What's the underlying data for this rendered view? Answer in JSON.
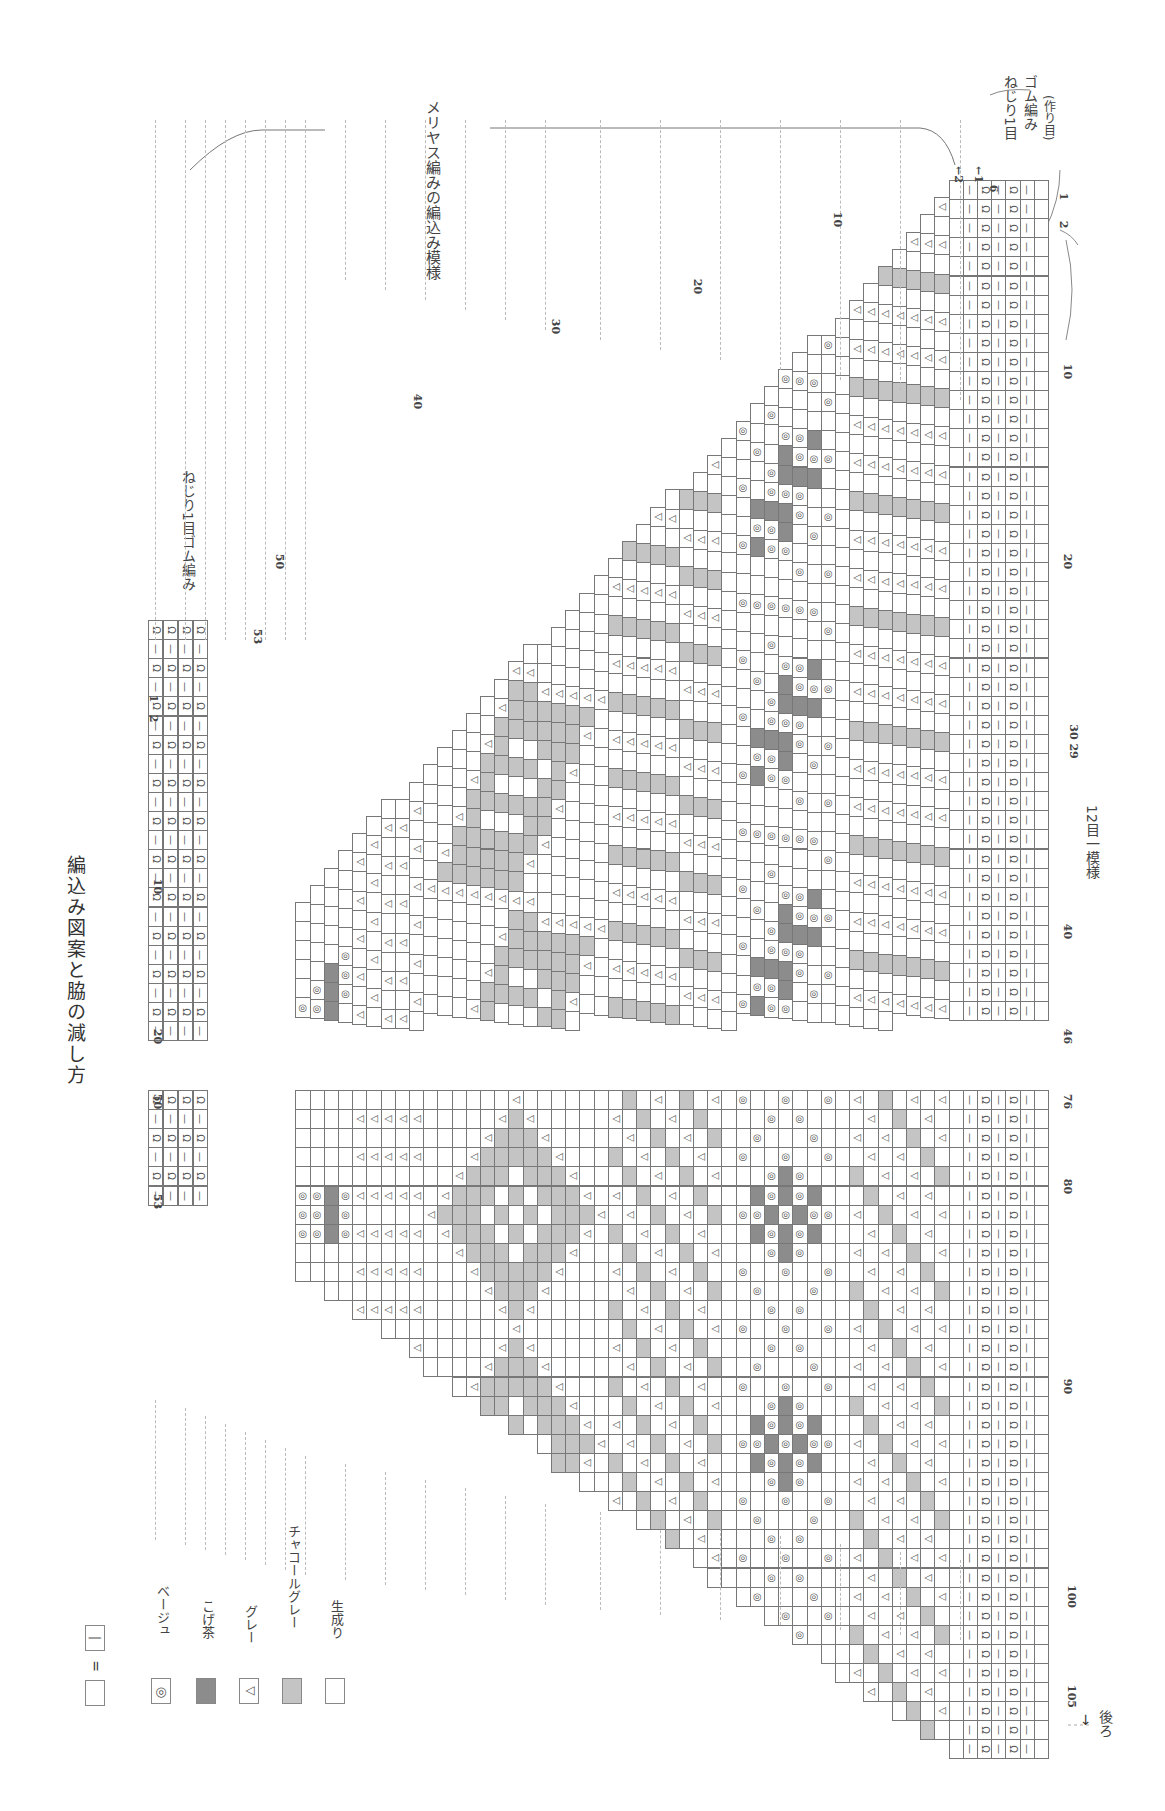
{
  "title": "編込み図案と脇の減し方",
  "front_label": "前",
  "back_label": "後ろ",
  "pattern_label": "メリヤス編みの編込み模様",
  "rib_label_side": "ねじり1目ゴム編み",
  "rib_label_bottom": [
    "ねじり1目",
    "ゴム編み",
    "(作り目)"
  ],
  "repeat_label": "12目一模様",
  "legend": {
    "equals": "=",
    "knit_symbol": "|",
    "items": [
      {
        "symbol": "◎",
        "label": "ベージュ",
        "swatch": "beige",
        "color": "#ffffff"
      },
      {
        "symbol": "",
        "label": "こげ茶",
        "swatch": "dark-brown",
        "color": "#8c8c8c"
      },
      {
        "symbol": "△",
        "label": "グレー",
        "swatch": "gray",
        "color": "#ffffff"
      },
      {
        "symbol": "",
        "label": "チャコールグレー",
        "swatch": "charcoal",
        "color": "#c4c4c4"
      },
      {
        "symbol": "",
        "label": "生成り",
        "swatch": "natural",
        "color": "#ffffff"
      }
    ]
  },
  "stitch_numbers_front": [
    "1",
    "10",
    "20",
    "29",
    "30",
    "40",
    "46"
  ],
  "stitch_numbers_back": [
    "76",
    "80",
    "90",
    "100",
    "105"
  ],
  "row_numbers_body": [
    "1",
    "2",
    "10",
    "20",
    "30",
    "40",
    "50",
    "53"
  ],
  "row_numbers_neck": [
    "1",
    "2",
    "4",
    "10",
    "20",
    "50",
    "53"
  ],
  "rib_rows": [
    "←1",
    "←2",
    "6"
  ],
  "colors": {
    "dark": "#8c8c8c",
    "mid": "#c4c4c4",
    "grid": "#777777",
    "dash": "#bbbbbb"
  }
}
